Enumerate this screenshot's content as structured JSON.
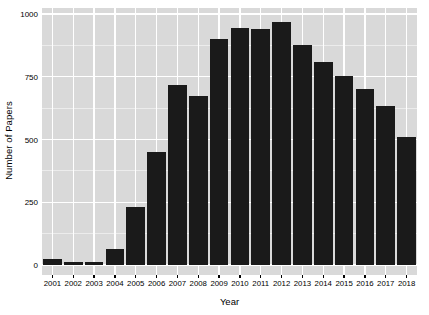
{
  "chart_data": {
    "type": "bar",
    "title": "",
    "xlabel": "Year",
    "ylabel": "Number of Papers",
    "categories": [
      "2001",
      "2002",
      "2003",
      "2004",
      "2005",
      "2006",
      "2007",
      "2008",
      "2009",
      "2010",
      "2011",
      "2012",
      "2013",
      "2014",
      "2015",
      "2016",
      "2017",
      "2018"
    ],
    "values": [
      25,
      12,
      12,
      62,
      232,
      450,
      718,
      672,
      902,
      945,
      942,
      968,
      878,
      810,
      752,
      700,
      632,
      512
    ],
    "ylim": [
      0,
      1000
    ],
    "yticks": [
      0,
      250,
      500,
      750,
      1000
    ],
    "ytick_labels": [
      "0",
      "250",
      "500",
      "750",
      "1000"
    ],
    "grid": true,
    "legend": "none",
    "bar_color": "#1a1a1a",
    "panel_color": "#d9d9d9",
    "gridline_color": "#ffffff",
    "background_color": "#ffffff"
  },
  "axes": {
    "y_title": "Number of Papers",
    "x_title": "Year"
  }
}
